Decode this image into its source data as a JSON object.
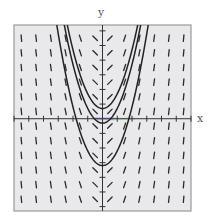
{
  "chart_data": {
    "type": "slope_field",
    "title": "",
    "xlabel": "x",
    "ylabel": "y",
    "xlim": [
      -6,
      6
    ],
    "ylim": [
      -6.3,
      6.4
    ],
    "grid": false,
    "background": "#e9e9ec",
    "frame_color": "#9a9a9a",
    "axis_color": "#333333",
    "differential_equation": "dy/dx = 2x",
    "slope_field_grid": {
      "x": [
        -5.5,
        -4.5,
        -3.5,
        -2.5,
        -1.5,
        -0.5,
        0.5,
        1.5,
        2.5,
        3.5,
        4.5,
        5.5
      ],
      "y": [
        -5.5,
        -4.5,
        -3.5,
        -2.5,
        -1.5,
        -0.5,
        0.5,
        1.5,
        2.5,
        3.5,
        4.5,
        5.5
      ]
    },
    "x_ticks": [
      -6,
      -5,
      -4,
      -3,
      -2,
      -1,
      1,
      2,
      3,
      4,
      5,
      6
    ],
    "y_ticks": [
      -6,
      -5,
      -4,
      -3,
      -2,
      -1,
      1,
      2,
      3,
      4,
      5,
      6
    ],
    "series": [
      {
        "name": "solution curve C=0.7",
        "equation": "y = x^2 + 0.7",
        "vertex": [
          0,
          0.7
        ],
        "color": "#222222"
      },
      {
        "name": "solution curve C=-0.3",
        "equation": "y = x^2 - 0.3",
        "vertex": [
          0,
          -0.3
        ],
        "color": "#222222"
      },
      {
        "name": "solution curve C=-3.2",
        "equation": "y = x^2 - 3.2",
        "vertex": [
          0,
          -3.2
        ],
        "color": "#222222"
      }
    ],
    "highlight": {
      "description": "faint purple/green highlight on x-axis near origin",
      "x_range": [
        -0.5,
        2.2
      ],
      "colors": [
        "#b49be0",
        "#9fd89a"
      ]
    }
  },
  "labels": {
    "x": "x",
    "y": "y"
  }
}
